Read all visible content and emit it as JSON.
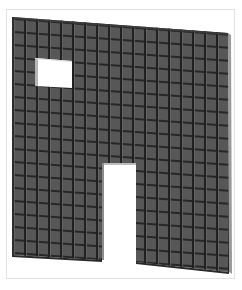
{
  "figure": {
    "openings": [
      {
        "type": "window"
      },
      {
        "type": "door"
      }
    ],
    "colors": {
      "panel_fill": "#555555",
      "grid_line": "#1e1e1e",
      "edge_light": "#9a9a9a",
      "frame_border": "#e2e2e2",
      "background": "#ffffff"
    },
    "grid": {
      "columns": 18,
      "rows": 20
    }
  }
}
